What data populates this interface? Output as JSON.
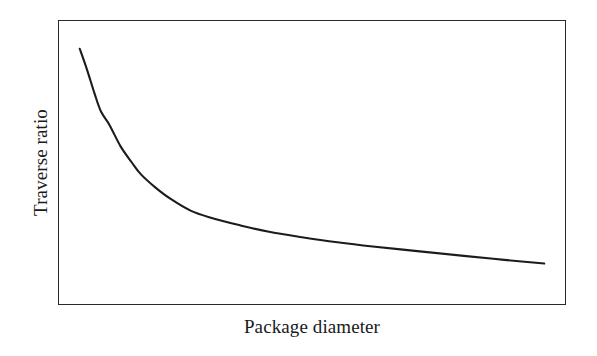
{
  "chart_data": {
    "type": "line",
    "title": "",
    "subtitle": "",
    "xlabel": "Package diameter",
    "ylabel": "Traverse ratio",
    "x_tick_labels": [],
    "y_tick_labels": [],
    "grid": false,
    "legend": null,
    "legend_position": "none",
    "annotations": [],
    "axis_note": "Schematic curve; axes are unlabeled/qualitative with no numeric ticks.",
    "xlim": [
      0,
      100
    ],
    "ylim": [
      0,
      100
    ],
    "series": [
      {
        "name": "Traverse ratio vs package diameter",
        "line_color": "#1c1c1c",
        "line_width_px": 2.1,
        "shape": "hyperbolic-decay",
        "x": [
          4.1,
          5.5,
          7.0,
          8.3,
          10.0,
          12.2,
          14.4,
          16.2,
          18.9,
          22.0,
          26.0,
          30.0,
          35.8,
          41.5,
          48.0,
          55.0,
          62.0,
          71.3,
          80.0,
          88.0,
          95.9
        ],
        "y": [
          90.2,
          83.0,
          74.5,
          68.0,
          63.2,
          55.6,
          50.0,
          45.8,
          41.4,
          37.2,
          33.0,
          30.5,
          27.8,
          25.5,
          23.6,
          21.8,
          20.3,
          18.6,
          17.0,
          15.6,
          14.3
        ]
      }
    ]
  },
  "figure": {
    "background_color": "#ffffff",
    "frame_color": "#2b2b2b",
    "curve_color": "#1c1c1c",
    "label_color": "#1a1a1a"
  }
}
